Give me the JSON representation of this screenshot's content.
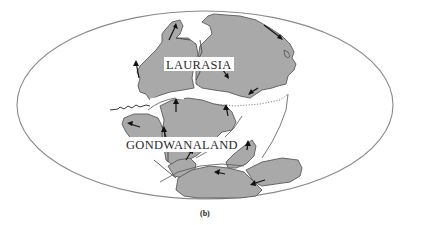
{
  "figure": {
    "type": "paleogeographic-map",
    "projection": "elliptical world projection",
    "caption": "(b)"
  },
  "labels": {
    "laurasia": "LAURASIA",
    "gondwanaland": "GONDWANALAND"
  },
  "colors": {
    "land": "#a9a9a9",
    "land_outline": "#5a5a5a",
    "globe_outline": "#8a8a8a",
    "arrow": "#111111",
    "background": "#ffffff"
  },
  "features": {
    "continents": [
      "Laurasia",
      "Gondwanaland"
    ],
    "motion_arrows": "black arrows indicating plate motion directions",
    "dotted_boundary": "dotted line marking former ocean margin",
    "ridge": "jagged spreading ridge line on the left"
  }
}
